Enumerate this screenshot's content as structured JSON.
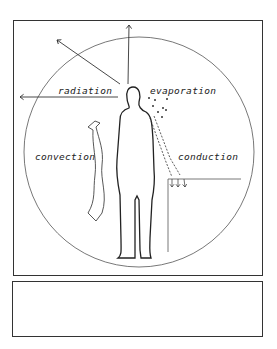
{
  "diagram": {
    "labels": {
      "radiation": "radiation",
      "evaporation": "evaporation",
      "convection": "convection",
      "conduction": "conduction"
    },
    "caption": ""
  }
}
